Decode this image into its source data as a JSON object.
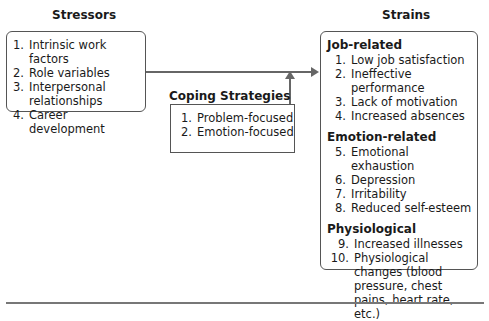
{
  "stressors": {
    "title": "Stressors",
    "items": [
      {
        "num": "1.",
        "text": "Intrinsic work factors"
      },
      {
        "num": "2.",
        "text": "Role variables"
      },
      {
        "num": "3.",
        "text": "Interpersonal relationships"
      },
      {
        "num": "4.",
        "text": "Career development"
      }
    ]
  },
  "coping": {
    "title": "Coping Strategies",
    "items": [
      {
        "num": "1.",
        "text": "Problem-focused"
      },
      {
        "num": "2.",
        "text": "Emotion-focused"
      }
    ]
  },
  "strains": {
    "title": "Strains",
    "sections": [
      {
        "title": "Job-related",
        "items": [
          {
            "num": "1.",
            "text": "Low job satisfaction"
          },
          {
            "num": "2.",
            "text": "Ineffective performance"
          },
          {
            "num": "3.",
            "text": "Lack of motivation"
          },
          {
            "num": "4.",
            "text": "Increased absences"
          }
        ]
      },
      {
        "title": "Emotion-related",
        "items": [
          {
            "num": "5.",
            "text": "Emotional exhaustion"
          },
          {
            "num": "6.",
            "text": "Depression"
          },
          {
            "num": "7.",
            "text": "Irritability"
          },
          {
            "num": "8.",
            "text": "Reduced self-esteem"
          }
        ]
      },
      {
        "title": "Physiological",
        "items": [
          {
            "num": "9.",
            "text": "Increased illnesses"
          },
          {
            "num": "10.",
            "text": "Physiological changes (blood pressure, chest pains, heart rate, etc.)"
          }
        ]
      }
    ]
  },
  "colors": {
    "line": "#666666",
    "border": "#555555",
    "text": "#1a1a1a"
  }
}
